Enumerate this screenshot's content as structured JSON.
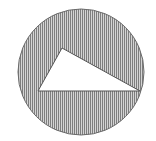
{
  "diagram": {
    "type": "geometry",
    "circle": {
      "cx": 81,
      "cy": 72,
      "r": 63,
      "fill": "vertical-hatch",
      "stroke": "#6a6a6a"
    },
    "triangle": {
      "points": [
        [
          62,
          48
        ],
        [
          38,
          91
        ],
        [
          140,
          91
        ]
      ],
      "fill": "#ffffff",
      "stroke": "#555555"
    },
    "colors": {
      "background": "#ffffff",
      "hatch_line": "#8a8a8a",
      "hatch_bg": "#d8d8d8"
    }
  }
}
